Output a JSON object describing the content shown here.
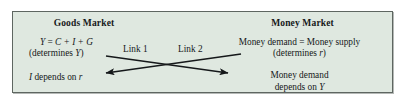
{
  "figure": {
    "background_color": "#dfe8e0",
    "border_color": "#5e6661",
    "text_color": "#16181a",
    "outside_color": "#ffffff"
  },
  "goods_market": {
    "title": "Goods Market",
    "equation": "Y = C + I + G",
    "equation_parts": {
      "lhs": "Y",
      "eq": " = ",
      "rhs": "C + I + G"
    },
    "determines_open": "(determines ",
    "determines_var": "Y",
    "determines_close": ")",
    "investment_var": "I",
    "investment_text": " depends on ",
    "investment_rate": "r"
  },
  "money_market": {
    "title": "Money Market",
    "equilibrium": "Money demand  =  Money supply",
    "determines_open": "(determines ",
    "determines_var": "r",
    "determines_close": ")",
    "demand_line_1": "Money demand",
    "demand_line_2_text": "depends on ",
    "demand_line_2_var": "Y"
  },
  "links": [
    {
      "label": "Link 1",
      "direction": "left-to-right",
      "from": "goods-market",
      "to": "money-market",
      "description": "Y from goods market determines money demand"
    },
    {
      "label": "Link 2",
      "direction": "right-to-left",
      "from": "money-market",
      "to": "goods-market",
      "description": "r from money market determines investment"
    }
  ]
}
